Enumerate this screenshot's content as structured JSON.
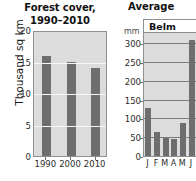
{
  "chart_data": [
    {
      "type": "bar",
      "id": "forest-cover",
      "title_line1": "Forest cover,",
      "title_line2": "1990–2010",
      "xlabel": "",
      "ylabel": "Thousand sq km",
      "categories": [
        "1990",
        "2000",
        "2010"
      ],
      "values": [
        15.9,
        14.9,
        14.0
      ],
      "ylim": [
        0,
        20
      ],
      "yticks": [
        0,
        5,
        10,
        15,
        20
      ],
      "ytick_labels": [
        "0",
        "5",
        "10",
        "15",
        "20"
      ],
      "grid": true,
      "legend": "none",
      "bar_color": "#6e6e6e",
      "plot_background": "#dcdcdc",
      "gridline_color": "#f7f7f7"
    },
    {
      "type": "bar",
      "id": "average-precipitation",
      "title": "Average",
      "panel_label": "Belm",
      "xlabel": "",
      "ylabel": "mm",
      "categories": [
        "J",
        "F",
        "M",
        "A",
        "M",
        "J"
      ],
      "values": [
        128,
        65,
        48,
        46,
        87,
        310
      ],
      "ylim": [
        0,
        330
      ],
      "yticks": [
        0,
        50,
        100,
        150,
        200,
        250,
        300
      ],
      "ytick_labels": [
        "0",
        "50",
        "100",
        "150",
        "200",
        "250",
        "300"
      ],
      "grid": true,
      "legend": "none",
      "clipped": "true",
      "bar_color": "#6e6e6e",
      "plot_background": "#dcdcdc",
      "gridline_color": "#7d7d7d"
    }
  ],
  "left_chart": {
    "title_line1": "Forest cover,",
    "title_line2": "1990–2010",
    "ylabel": "Thousand sq km"
  },
  "right_chart": {
    "title": "Average",
    "panel_label": "Belm",
    "unit": "mm"
  }
}
